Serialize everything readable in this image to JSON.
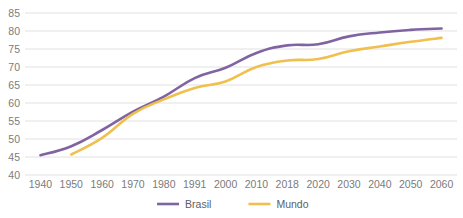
{
  "chart_data": {
    "type": "line",
    "title": "",
    "subtitle": "",
    "xlabel": "",
    "ylabel": "",
    "grid": "horizontal",
    "legend_position": "bottom-center",
    "categories": [
      "1940",
      "1950",
      "1960",
      "1970",
      "1980",
      "1991",
      "2000",
      "2010",
      "2018",
      "2020",
      "2030",
      "2040",
      "2050",
      "2060"
    ],
    "ylim": [
      40,
      85
    ],
    "yticks": [
      "40",
      "45",
      "50",
      "55",
      "60",
      "65",
      "70",
      "75",
      "80",
      "85"
    ],
    "ytick_values": [
      40,
      45,
      50,
      55,
      60,
      65,
      70,
      75,
      80,
      85
    ],
    "series": [
      {
        "name": "Brasil",
        "color": "#8064A2",
        "values": [
          45.5,
          48.0,
          52.5,
          57.6,
          61.8,
          66.9,
          69.8,
          73.9,
          76.0,
          76.3,
          78.5,
          79.6,
          80.3,
          80.7
        ]
      },
      {
        "name": "Mundo",
        "color": "#F0C04E",
        "values": [
          null,
          45.7,
          50.3,
          57.0,
          61.0,
          64.2,
          66.0,
          70.0,
          71.8,
          72.2,
          74.4,
          75.7,
          77.0,
          78.1
        ]
      }
    ]
  },
  "legend": {
    "items": [
      {
        "label": "Brasil",
        "color": "#8064A2"
      },
      {
        "label": "Mundo",
        "color": "#F0C04E"
      }
    ]
  },
  "colors": {
    "brasil": "#8064A2",
    "mundo": "#F0C04E",
    "gridline": "#d9d9d9",
    "tick_text": "#7b7b7b",
    "background": "#ffffff"
  }
}
